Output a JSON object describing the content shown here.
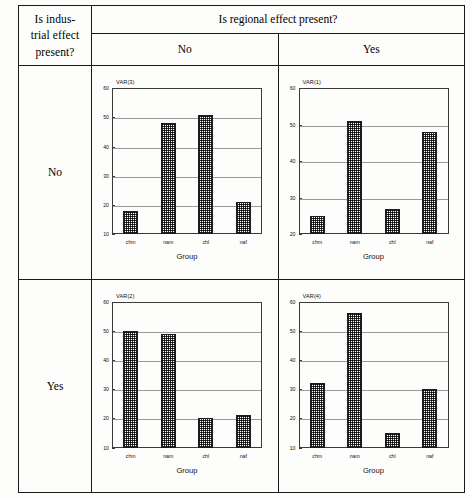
{
  "table": {
    "corner_label_lines": [
      "Is indus-",
      "trial effect",
      "present?"
    ],
    "column_group_header": "Is regional effect present?",
    "column_headers": [
      "No",
      "Yes"
    ],
    "row_headers": [
      "No",
      "Yes"
    ]
  },
  "chart_data": [
    {
      "type": "bar",
      "title": "VAR(3)",
      "cell": "industrial=No, regional=No",
      "categories": [
        "chm",
        "nam",
        "chl",
        "naf"
      ],
      "values": [
        18,
        48,
        51,
        21
      ],
      "xlabel": "Group",
      "ylabel": "",
      "ylim": [
        10,
        60
      ],
      "yticks": [
        10,
        20,
        30,
        40,
        50,
        60
      ],
      "grid": true,
      "legend": false
    },
    {
      "type": "bar",
      "title": "VAR(1)",
      "cell": "industrial=No, regional=Yes",
      "categories": [
        "chm",
        "nam",
        "chl",
        "naf"
      ],
      "values": [
        25,
        51,
        27,
        48
      ],
      "xlabel": "Group",
      "ylabel": "",
      "ylim": [
        20,
        60
      ],
      "yticks": [
        20,
        30,
        40,
        50,
        60
      ],
      "grid": true,
      "legend": false
    },
    {
      "type": "bar",
      "title": "VAR(2)",
      "cell": "industrial=Yes, regional=No",
      "categories": [
        "chm",
        "nam",
        "chl",
        "naf"
      ],
      "values": [
        50,
        49,
        20,
        21
      ],
      "xlabel": "Group",
      "ylabel": "",
      "ylim": [
        10,
        60
      ],
      "yticks": [
        10,
        20,
        30,
        40,
        50,
        60
      ],
      "grid": true,
      "legend": false
    },
    {
      "type": "bar",
      "title": "VAR(4)",
      "cell": "industrial=Yes, regional=Yes",
      "categories": [
        "chm",
        "nam",
        "chl",
        "naf"
      ],
      "values": [
        32,
        56,
        15,
        30
      ],
      "xlabel": "Group",
      "ylabel": "",
      "ylim": [
        10,
        60
      ],
      "yticks": [
        10,
        20,
        30,
        40,
        50,
        60
      ],
      "grid": true,
      "legend": false
    }
  ],
  "colors": {
    "ink": "#1a1a1a",
    "bar_fill": "#2e2e2e",
    "grid": "#9a9a9a",
    "page": "#fdfdfb"
  }
}
